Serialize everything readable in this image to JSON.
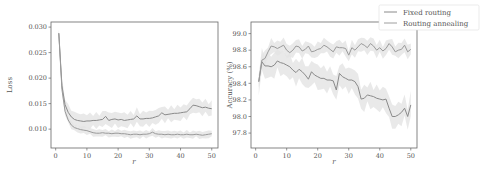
{
  "chart_data": [
    {
      "type": "line",
      "title": "",
      "xlabel": "r",
      "ylabel": "Loss",
      "xlim": [
        -1.5,
        52
      ],
      "ylim": [
        0.0063,
        0.031
      ],
      "xticks": [
        0,
        10,
        20,
        30,
        40,
        50
      ],
      "yticks": [
        0.01,
        0.015,
        0.02,
        0.025,
        0.03
      ],
      "ytick_labels": [
        "0.010",
        "0.015",
        "0.020",
        "0.025",
        "0.030"
      ],
      "grid": false,
      "x": [
        1,
        2,
        3,
        4,
        5,
        6,
        7,
        8,
        9,
        10,
        11,
        12,
        13,
        14,
        15,
        16,
        17,
        18,
        19,
        20,
        21,
        22,
        23,
        24,
        25,
        26,
        27,
        28,
        29,
        30,
        31,
        32,
        33,
        34,
        35,
        36,
        37,
        38,
        39,
        40,
        41,
        42,
        43,
        44,
        45,
        46,
        47,
        48,
        49,
        50
      ],
      "series": [
        {
          "name": "Fixed routing",
          "values": [
            0.0288,
            0.0185,
            0.0148,
            0.0133,
            0.0124,
            0.0119,
            0.0117,
            0.0116,
            0.0115,
            0.0116,
            0.0116,
            0.0117,
            0.0117,
            0.0118,
            0.0119,
            0.0125,
            0.0117,
            0.0119,
            0.012,
            0.0118,
            0.0119,
            0.0117,
            0.0118,
            0.0119,
            0.012,
            0.0126,
            0.012,
            0.012,
            0.0121,
            0.0121,
            0.0122,
            0.0124,
            0.0126,
            0.0132,
            0.0128,
            0.0129,
            0.013,
            0.0131,
            0.0131,
            0.0132,
            0.0133,
            0.0134,
            0.014,
            0.0147,
            0.0146,
            0.0144,
            0.0142,
            0.0143,
            0.0141,
            0.014
          ],
          "band": 0.0012
        },
        {
          "name": "Routing annealing",
          "values": [
            0.0288,
            0.0178,
            0.0135,
            0.0118,
            0.0108,
            0.0103,
            0.0101,
            0.0099,
            0.0098,
            0.0097,
            0.0095,
            0.0093,
            0.0092,
            0.0092,
            0.0093,
            0.0092,
            0.0092,
            0.0091,
            0.0092,
            0.0092,
            0.0091,
            0.0091,
            0.009,
            0.0089,
            0.009,
            0.009,
            0.0089,
            0.009,
            0.009,
            0.0091,
            0.0094,
            0.0091,
            0.009,
            0.009,
            0.0089,
            0.009,
            0.0089,
            0.0089,
            0.009,
            0.0089,
            0.0089,
            0.009,
            0.0089,
            0.0089,
            0.009,
            0.0089,
            0.0088,
            0.0089,
            0.009,
            0.0091
          ],
          "band": 0.0006
        }
      ]
    },
    {
      "type": "line",
      "title": "",
      "xlabel": "r",
      "ylabel": "Accuracy (%)",
      "xlim": [
        -1.5,
        52
      ],
      "ylim": [
        97.62,
        99.14
      ],
      "xticks": [
        0,
        10,
        20,
        30,
        40,
        50
      ],
      "yticks": [
        97.8,
        98.0,
        98.2,
        98.4,
        98.6,
        98.8,
        99.0
      ],
      "ytick_labels": [
        "97.8",
        "98.0",
        "98.2",
        "98.4",
        "98.6",
        "98.8",
        "99.0"
      ],
      "grid": false,
      "legend": {
        "position": "upper right (outside)",
        "entries": [
          "Fixed routing",
          "Routing annealing"
        ]
      },
      "x": [
        1,
        2,
        3,
        4,
        5,
        6,
        7,
        8,
        9,
        10,
        11,
        12,
        13,
        14,
        15,
        16,
        17,
        18,
        19,
        20,
        21,
        22,
        23,
        24,
        25,
        26,
        27,
        28,
        29,
        30,
        31,
        32,
        33,
        34,
        35,
        36,
        37,
        38,
        39,
        40,
        41,
        42,
        43,
        44,
        45,
        46,
        47,
        48,
        49,
        50
      ],
      "series": [
        {
          "name": "Fixed routing",
          "values": [
            98.42,
            98.66,
            98.61,
            98.61,
            98.6,
            98.62,
            98.67,
            98.65,
            98.64,
            98.62,
            98.6,
            98.56,
            98.53,
            98.57,
            98.54,
            98.5,
            98.45,
            98.54,
            98.5,
            98.48,
            98.46,
            98.46,
            98.44,
            98.44,
            98.43,
            98.32,
            98.52,
            98.48,
            98.46,
            98.44,
            98.44,
            98.42,
            98.36,
            98.21,
            98.22,
            98.26,
            98.25,
            98.24,
            98.22,
            98.21,
            98.2,
            98.21,
            98.1,
            98.0,
            98.0,
            98.02,
            98.05,
            98.1,
            98.0,
            98.14
          ],
          "band": 0.12
        },
        {
          "name": "Routing annealing",
          "values": [
            98.42,
            98.68,
            98.7,
            98.78,
            98.85,
            98.84,
            98.82,
            98.84,
            98.86,
            98.8,
            98.77,
            98.8,
            98.85,
            98.84,
            98.79,
            98.81,
            98.85,
            98.78,
            98.79,
            98.81,
            98.82,
            98.86,
            98.84,
            98.81,
            98.78,
            98.84,
            98.83,
            98.83,
            98.82,
            98.74,
            98.83,
            98.8,
            98.84,
            98.88,
            98.86,
            98.83,
            98.88,
            98.85,
            98.8,
            98.83,
            98.79,
            98.82,
            98.88,
            98.84,
            98.78,
            98.8,
            98.81,
            98.86,
            98.78,
            98.81
          ],
          "band": 0.07
        }
      ]
    }
  ],
  "plots": {
    "left": {
      "ylabel": "Loss",
      "xlabel": "r"
    },
    "right": {
      "ylabel": "Accuracy (%)",
      "xlabel": "r"
    }
  },
  "legend": {
    "entries": [
      {
        "label": "Fixed routing",
        "color": "#8a8a8a"
      },
      {
        "label": "Routing annealing",
        "color": "#9e9e9e"
      }
    ]
  },
  "colors": {
    "line_fixed": "#8a8a8a",
    "line_anneal": "#9a9a9a",
    "band": "#e4e4e4",
    "axes": "#666666"
  }
}
